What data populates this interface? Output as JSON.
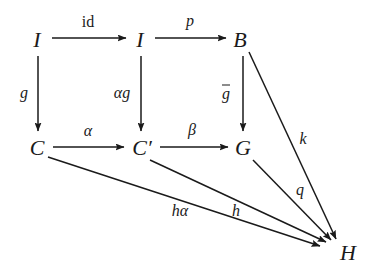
{
  "figure": {
    "kind": "commutative-diagram",
    "background_color": "#ffffff",
    "ink_color": "#1a1a1a"
  },
  "nodes": [
    {
      "id": "I1",
      "label": "I",
      "x": 37,
      "y": 40
    },
    {
      "id": "I2",
      "label": "I",
      "x": 140,
      "y": 40
    },
    {
      "id": "B",
      "label": "B",
      "x": 240,
      "y": 40
    },
    {
      "id": "C",
      "label": "C",
      "x": 37,
      "y": 148
    },
    {
      "id": "C2",
      "label": "C′",
      "x": 142,
      "y": 148
    },
    {
      "id": "G",
      "label": "G",
      "x": 243,
      "y": 148
    },
    {
      "id": "H",
      "label": "H",
      "x": 348,
      "y": 253
    }
  ],
  "edges": [
    {
      "id": "id",
      "from": "I1",
      "to": "I2",
      "label": "id",
      "style": "roman",
      "label_x": 88,
      "label_y": 22
    },
    {
      "id": "p",
      "from": "I2",
      "to": "B",
      "label": "p",
      "style": "italic",
      "label_x": 190,
      "label_y": 21
    },
    {
      "id": "g",
      "from": "I1",
      "to": "C",
      "label": "g",
      "style": "italic",
      "label_x": 24,
      "label_y": 93
    },
    {
      "id": "alphag",
      "from": "I2",
      "to": "C2",
      "label": "αg",
      "style": "italic",
      "label_x": 122,
      "label_y": 93
    },
    {
      "id": "gbar",
      "from": "B",
      "to": "G",
      "label": "g",
      "style": "italic-overbar",
      "label_x": 226,
      "label_y": 93
    },
    {
      "id": "alpha",
      "from": "C",
      "to": "C2",
      "label": "α",
      "style": "italic",
      "label_x": 88,
      "label_y": 131
    },
    {
      "id": "beta",
      "from": "C2",
      "to": "G",
      "label": "β",
      "style": "italic",
      "label_x": 192,
      "label_y": 130
    },
    {
      "id": "k",
      "from": "B",
      "to": "H",
      "label": "k",
      "style": "italic",
      "label_x": 303,
      "label_y": 139
    },
    {
      "id": "q",
      "from": "G",
      "to": "H",
      "label": "q",
      "style": "italic",
      "label_x": 300,
      "label_y": 190
    },
    {
      "id": "h",
      "from": "C2",
      "to": "H",
      "label": "h",
      "style": "italic",
      "label_x": 236,
      "label_y": 211
    },
    {
      "id": "halpha",
      "from": "C",
      "to": "H",
      "label": "hα",
      "style": "italic",
      "label_x": 180,
      "label_y": 211
    }
  ]
}
